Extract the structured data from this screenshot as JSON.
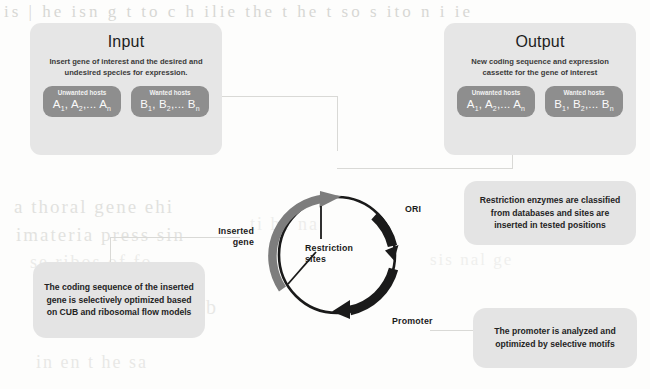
{
  "figure": {
    "background_color": "#fdfdfc",
    "panel_color": "#e6e6e6",
    "host_box_color": "#8e8e8e",
    "callout_color": "#e4e4e4",
    "dark_segment_color": "#1a1a1a",
    "light_segment_color": "#7d7d7d"
  },
  "input_panel": {
    "title": "Input",
    "subtitle": "Insert gene of interest and the desired and undesired species for expression.",
    "hosts": [
      {
        "label": "Unwanted hosts",
        "values_html": "A<sub>1</sub>, A<sub>2</sub>,... A<sub>n</sub>",
        "values_text": "A1, A2,... An"
      },
      {
        "label": "Wanted hosts",
        "values_html": "B<sub>1</sub>, B<sub>2</sub>,... B<sub>n</sub>",
        "values_text": "B1, B2,... Bn"
      }
    ]
  },
  "output_panel": {
    "title": "Output",
    "subtitle": "New coding sequence and expression cassette for the gene of interest",
    "hosts": [
      {
        "label": "Unwanted hosts",
        "values_html": "A<sub>1</sub>, A<sub>2</sub>,... A<sub>n</sub>",
        "values_text": "A1, A2,... An"
      },
      {
        "label": "Wanted hosts",
        "values_html": "B<sub>1</sub>, B<sub>2</sub>,... B<sub>n</sub>",
        "values_text": "B1, B2,... Bn"
      }
    ]
  },
  "plasmid": {
    "labels": {
      "ori": "ORI",
      "promoter": "Promoter",
      "inserted_gene": "Inserted gene",
      "restriction_sites": "Restriction sites"
    }
  },
  "callouts": [
    {
      "id": "restriction-enzymes",
      "bold_lead": "Restriction enzymes",
      "rest": " are classified from databases and sites are inserted in tested positions",
      "full_text": "Restriction enzymes are classified from databases and sites are inserted in tested positions"
    },
    {
      "id": "coding-sequence",
      "bold_lead": "The coding sequence",
      "rest": " of the inserted gene is selectively optimized based on CUB and ribosomal flow models",
      "full_text": "The coding sequence of the inserted gene is selectively optimized based on CUB and ribosomal flow models"
    },
    {
      "id": "promoter-optimization",
      "bold_lead": "The promoter",
      "rest": " is analyzed and optimized by selective motifs",
      "full_text": "The promoter is analyzed and optimized by selective motifs"
    }
  ],
  "bleed_through": {
    "l1": "is  |  he  isn  g  t  to  c  h  ilie  the  t  he  t  so  s  ito  n  i  ie",
    "l2": "a  thoral  gene  ehi",
    "l3": "imateria  press  sin",
    "l4": "se  ribos  of  fo",
    "l5": "to  nai  ul  tub",
    "l6": "in  en  t  he  sa",
    "l7": "ti  he  na",
    "l8": "sis  nal  ge"
  }
}
